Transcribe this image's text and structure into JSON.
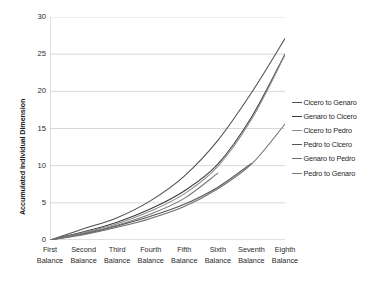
{
  "chart_data": {
    "type": "line",
    "title": "",
    "xlabel": "",
    "ylabel": "Accumulated Individual Dimension",
    "ylim": [
      0,
      30
    ],
    "yticks": [
      0,
      5,
      10,
      15,
      20,
      25,
      30
    ],
    "grid": "horizontal",
    "legend_position": "right",
    "categories": [
      "First Balance",
      "Second Balance",
      "Third Balance",
      "Fourth Balance",
      "Fifth Balance",
      "Sixth Balance",
      "Seventh Balance",
      "Eighth Balance"
    ],
    "category_lines": [
      [
        "First",
        "Balance"
      ],
      [
        "Second",
        "Balance"
      ],
      [
        "Third",
        "Balance"
      ],
      [
        "Fourth",
        "Balance"
      ],
      [
        "Fifth",
        "Balance"
      ],
      [
        "Sixth",
        "Balance"
      ],
      [
        "Seventh",
        "Balance"
      ],
      [
        "Eighth",
        "Balance"
      ]
    ],
    "series": [
      {
        "name": "Cicero to Genaro",
        "color": "#4f4f4f",
        "values": [
          0,
          1.5,
          3.0,
          5.3,
          8.6,
          13.4,
          19.8,
          27.1
        ]
      },
      {
        "name": "Genaro to Cicero",
        "color": "#3c3c3c",
        "values": [
          0,
          1.1,
          2.4,
          4.2,
          6.6,
          10.2,
          16.5,
          25.0
        ]
      },
      {
        "name": "Cicero to Pedro",
        "color": "#8c8c8c",
        "values": [
          0,
          1.0,
          2.2,
          3.9,
          6.2,
          9.9,
          16.2,
          24.9
        ]
      },
      {
        "name": "Pedro to Cicero",
        "color": "#555555",
        "values": [
          0,
          0.8,
          1.9,
          3.2,
          4.8,
          7.1,
          10.3,
          null
        ]
      },
      {
        "name": "Genaro to Pedro",
        "color": "#6e6e6e",
        "values": [
          0,
          0.7,
          1.7,
          2.9,
          4.5,
          6.9,
          10.2,
          15.6
        ]
      },
      {
        "name": "Pedro to Genaro",
        "color": "#777777",
        "values": [
          0,
          0.9,
          2.0,
          3.5,
          5.6,
          9.0,
          null,
          null
        ]
      }
    ]
  },
  "axes": {
    "y_title": "Accumulated Individual Dimension",
    "y_tick_labels": [
      "30",
      "25",
      "20",
      "15",
      "10",
      "5",
      "0"
    ]
  },
  "legend": {
    "items": [
      {
        "label": "Cicero to Genaro"
      },
      {
        "label": "Genaro to Cicero"
      },
      {
        "label": "Cicero to Pedro"
      },
      {
        "label": "Pedro to Cicero"
      },
      {
        "label": "Genaro to Pedro"
      },
      {
        "label": "Pedro to Genaro"
      }
    ]
  },
  "style": {
    "gridline_color": "#d9d9d9",
    "axis_color": "#bfbfbf",
    "text_color": "#2a2a2a",
    "background": "#ffffff"
  }
}
